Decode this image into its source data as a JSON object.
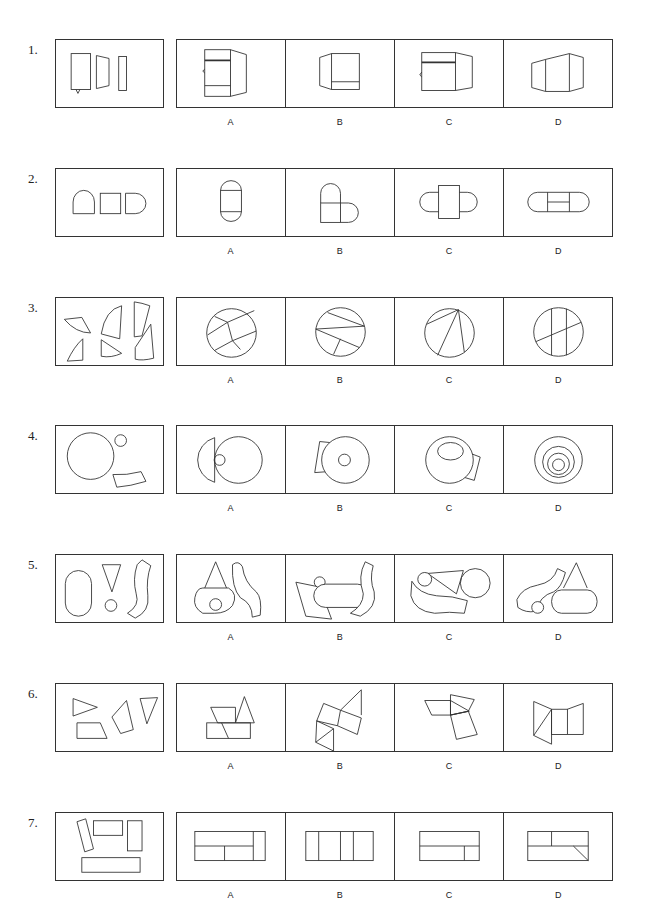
{
  "questions": [
    {
      "number": "1.",
      "top": 39,
      "question_svg": "<rect x='15' y='14' width='20' height='37'/><path d='M41 16 L54 19 L54 47 L41 50 Z'/><rect x='64' y='17' width='8' height='35'/><path d='M20 51 L22 55 L24 51'/>",
      "options": [
        {
          "label": "A",
          "svg": "<rect x='28' y='10' width='26' height='48'/><line x1='28' y1='21' x2='54' y2='21' style='stroke-width:1.8'/><line x1='28' y1='47' x2='54' y2='47'/><path d='M54 10 L70 15 L70 54 L54 58'/><path d='M28 30 L26 32 L28 34'/>"
        },
        {
          "label": "B",
          "svg": "<rect x='46' y='14' width='28' height='37'/><line x1='46' y1='43' x2='74' y2='43'/><path d='M46 14 L34 18 L34 47 L46 51'/>"
        },
        {
          "label": "C",
          "svg": "<rect x='27' y='13' width='34' height='39'/><line x1='27' y1='23' x2='61' y2='23' style='stroke-width:1.8'/><path d='M61 13 L78 17 L78 49 L61 52'/><path d='M27 33 L25 36 L27 38'/>"
        },
        {
          "label": "D",
          "svg": "<path d='M28 24 L42 20 L42 53 L28 49 Z'/><path d='M42 20 L66 14 L66 53 L42 53'/><path d='M66 14 L80 18 L80 49 L66 53'/>"
        }
      ]
    },
    {
      "number": "2.",
      "top": 168,
      "question_svg": "<path d='M17 46 L17 34 A11 12 0 0 1 39 34 L39 46 Z'/><rect x='45' y='25' width='21' height='21'/><path d='M71 25 L81 25 A11 10.5 0 0 1 81 46 L71 46 Z'/>",
      "options": [
        {
          "label": "A",
          "svg": "<rect x='44' y='22' width='21' height='22'/><path d='M44 22 A10.5 10 0 0 1 65 22'/><path d='M44 44 A10.5 10 0 0 0 65 44'/>"
        },
        {
          "label": "B",
          "svg": "<rect x='35' y='35' width='20' height='20'/><path d='M35 35 L35 25 A10 10 0 0 1 55 25 L55 35'/><path d='M55 35 L63 35 A10 10 0 0 1 63 55 L55 55'/>"
        },
        {
          "label": "C",
          "svg": "<rect x='44' y='17' width='21' height='34'/><path d='M44 24 L35 24 A10 10 0 0 0 35 44 L44 44'/><path d='M65 24 L73 24 A10 10 0 0 1 73 44 L65 44'/>"
        },
        {
          "label": "D",
          "svg": "<path d='M34 24 L76 24 A10 10 0 0 1 76 44 L34 44 A10 10 0 0 1 34 24 Z'/><line x1='44' y1='24' x2='44' y2='44'/><line x1='66' y1='24' x2='66' y2='44'/><line x1='44' y1='34' x2='66' y2='34'/>"
        }
      ]
    },
    {
      "number": "3.",
      "top": 297,
      "question_svg": "<path d='M8 22 L26 20 L35 36 Q20 36 8 22 Z'/><path d='M27 42 L27 64 L11 65 Q18 50 27 42 Z'/><path d='M67 8 L65 42 L46 37 Q50 12 67 8 Z'/><path d='M46 43 L67 57 Q56 62 46 60 Z'/><path d='M80 4 Q88 5 96 8 L88 39 L80 40 Z'/><path d='M97 27 L100 62 Q88 65 81 63 L81 51 Z'/>",
      "options": [
        {
          "label": "A",
          "svg": "<circle cx='55' cy='36' r='25'/><line x1='38' y1='19' x2='51' y2='25'/><line x1='31' y1='38' x2='51' y2='25'/><line x1='51' y1='25' x2='78' y2='13'/><line x1='51' y1='25' x2='56' y2='44'/><line x1='56' y1='44' x2='80' y2='34'/><line x1='56' y1='44' x2='64' y2='53'/><line x1='56' y1='44' x2='38' y2='54'/>"
        },
        {
          "label": "B",
          "svg": "<circle cx='55' cy='35' r='25'/><line x1='42' y1='15' x2='79' y2='29'/><line x1='30' y1='32' x2='79' y2='29'/><line x1='30' y1='32' x2='74' y2='51'/><line x1='55' y1='42' x2='48' y2='58'/>"
        },
        {
          "label": "C",
          "svg": "<circle cx='55' cy='36' r='25'/><line x1='64' y1='12' x2='32' y2='27'/><line x1='64' y1='12' x2='43' y2='59'/><line x1='64' y1='12' x2='70' y2='56'/>"
        },
        {
          "label": "D",
          "svg": "<circle cx='55' cy='35' r='25'/><line x1='48' y1='11' x2='48' y2='59'/><line x1='63' y1='11' x2='63' y2='59'/><line x1='32' y1='45' x2='78' y2='25'/>"
        }
      ]
    },
    {
      "number": "4.",
      "top": 425,
      "question_svg": "<circle cx='35' cy='31' r='24'/><circle cx='66' cy='15' r='6'/><path d='M58 50 Q72 51 87 47 L92 57 Q76 62 62 63 Z'/>",
      "options": [
        {
          "label": "A",
          "svg": "<circle cx='62' cy='35' r='24'/><path d='M38 12 A24 24 0 0 0 38 58 Z'/><circle cx='43' cy='35' r='5.5'/>"
        },
        {
          "label": "B",
          "svg": "<path d='M34 16 L44 17 L42 47 L29 48 Z' style='fill:#fff'/><circle cx='60' cy='35' r='24' style='fill:#fff'/><circle cx='59' cy='35' r='6'/>"
        },
        {
          "label": "C",
          "svg": "<path d='M73 27 L86 32 L80 56 L67 52 Z' style='fill:#fff'/><circle cx='55' cy='35' r='24' style='fill:#fff'/><ellipse cx='56' cy='26' rx='13' ry='9'/>"
        },
        {
          "label": "D",
          "svg": "<circle cx='55' cy='35' r='24'/><circle cx='55' cy='37' r='16'/><circle cx='55' cy='39' r='11'/><circle cx='55' cy='40' r='6'/>"
        }
      ]
    },
    {
      "number": "5.",
      "top": 554,
      "question_svg": "<rect x='9' y='16' width='27' height='47' rx='13.5'/><path d='M47 10 L66 10 L57 38 Z'/><circle cx='56' cy='52' r='6'/><path d='M88 5 L97 11 Q92 25 94 42 Q96 58 81 65 L73 60 Q86 52 82 40 Q78 25 83 10 Z'/>",
      "options": [
        {
          "label": "A",
          "svg": "<path d='M28 34 L39 7 L50 34'/><path d='M26 34 L52 34 Q62 40 56 52 Q50 60 38 60 L26 60 Q16 54 18 44 Q20 34 26 34 Z'/><circle cx='39' cy='51' r='6'/><path d='M56 10 Q62 5 66 12 Q68 28 80 38 Q86 44 84 62 L76 64 Q76 50 64 44 Q55 34 56 10 Z'/>"
        },
        {
          "label": "B",
          "svg": "<path d='M10 28 L34 33 L46 66 L20 63 Z' style='fill:#fff'/><circle cx='34' cy='28' r='5.5' style='fill:#fff'/><path d='M40 30 L72 30 A12 12 0 0 1 72 54 L40 54 A12 12 0 0 1 40 30 Z' style='fill:#fff'/><path d='M80 7 L88 11 Q84 25 89 38 Q92 54 75 63 L65 60 Q78 52 78 40 Q72 22 80 7 Z' style='fill:#fff'/>"
        },
        {
          "label": "C",
          "svg": "<path d='M17 27 Q24 40 42 42 Q58 42 73 47 L70 60 Q55 58 40 60 Q20 58 16 42 Z'/><path d='M33 19 L69 16 L62 40 Z'/><circle cx='30' cy='25' r='7' style='fill:#fff'/><circle cx='81' cy='29' r='15'/>"
        },
        {
          "label": "D",
          "svg": "<path d='M60 34 L73 8 L84 34'/><path d='M58 36 L84 36 A10 12 0 0 1 84 60 L58 60 A10 12 0 0 1 58 36 Z'/><path d='M13 46 Q18 34 34 31 Q50 28 54 14 L62 18 Q58 34 50 38 Q36 42 32 58 Q22 60 14 54 Z'/><circle cx='34' cy='54' r='6' style='fill:#fff'/>"
        }
      ]
    },
    {
      "number": "6.",
      "top": 683,
      "question_svg": "<path d='M17 15 L42 24 L17 33 Z'/><path d='M21 40 L45 40 L52 56 L21 56 Z'/><path d='M72 17 L79 47 L66 51 L57 34 Z'/><path d='M86 15 L104 14 L93 41 Z'/>",
      "options": [
        {
          "label": "A",
          "svg": "<rect x='30' y='40' width='44' height='16'/><line x1='45' y1='40' x2='52' y2='56'/><path d='M34 24 L59 24 L59 40 L41 40 Z'/><path d='M59 40 L68 13 L78 40 Z'/>"
        },
        {
          "label": "B",
          "svg": "<path d='M38 20 L55 27 L52 43 L31 38 Z'/><path d='M55 27 L76 35 L72 52 L52 43'/><path d='M55 27 L76 6 L76 32'/><path d='M31 38 L30 60 L48 46 Z'/><path d='M30 60 L48 69 L48 46'/>"
        },
        {
          "label": "C",
          "svg": "<path d='M30 17 L56 17 L56 32 L37 32 Z'/><path d='M56 17 L56 32 L75 28 Z'/><path d='M56 11 L80 16 L74 28 L56 32 Z'/><path d='M56 32 L74 28 L83 52 L62 57 Z'/>"
        },
        {
          "label": "D",
          "svg": "<path d='M30 18 L48 26 L30 53 Z'/><path d='M48 26 L48 62 L30 53'/><rect x='48' y='26' width='16' height='26'/><path d='M64 26 L80 20 L80 52 L64 52'/>"
        }
      ]
    },
    {
      "number": "7.",
      "top": 812,
      "question_svg": "<path d='M21 9 L30 6 L38 37 L29 40 Z'/><rect x='38' y='8' width='30' height='15'/><rect x='73' y='8' width='15' height='31'/><rect x='26' y='46' width='60' height='15'/>",
      "options": [
        {
          "label": "A",
          "svg": "<rect x='18' y='19' width='71' height='30'/><line x1='77' y1='19' x2='77' y2='49'/><line x1='18' y1='34' x2='77' y2='34'/><line x1='48' y1='34' x2='48' y2='49'/>"
        },
        {
          "label": "B",
          "svg": "<rect x='20' y='19' width='68' height='30'/><line x1='33' y1='19' x2='33' y2='49'/><line x1='55' y1='19' x2='55' y2='49'/><line x1='68' y1='19' x2='68' y2='49'/>"
        },
        {
          "label": "C",
          "svg": "<rect x='25' y='19' width='60' height='30'/><line x1='25' y1='34' x2='85' y2='34'/><line x1='70' y1='34' x2='70' y2='49'/>"
        },
        {
          "label": "D",
          "svg": "<rect x='24' y='19' width='61' height='30'/><line x1='24' y1='34' x2='85' y2='34'/><line x1='48' y1='19' x2='48' y2='34'/><line x1='70' y1='34' x2='85' y2='49'/>"
        }
      ]
    }
  ]
}
